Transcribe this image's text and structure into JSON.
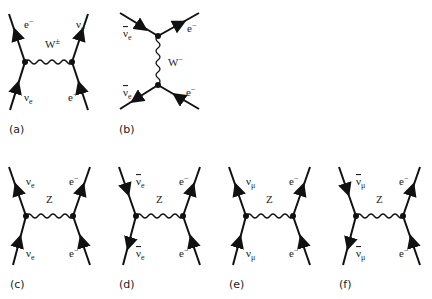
{
  "figure": {
    "diagrams": [
      {
        "id": "a",
        "caption": "(a)",
        "boson": "W±",
        "boson_base": "W",
        "boson_sup": "±",
        "incoming_left": {
          "base": "ν",
          "sub": "e",
          "bar": false
        },
        "outgoing_left": {
          "base": "e",
          "sup": "−",
          "bar": false
        },
        "outgoing_right": {
          "base": "ν",
          "sub": "e",
          "bar": false
        },
        "incoming_right": {
          "base": "e",
          "sup": "−",
          "bar": false
        }
      },
      {
        "id": "b",
        "caption": "(b)",
        "boson": "W−",
        "boson_base": "W",
        "boson_sup": "−",
        "top_left": {
          "base": "ν",
          "sub": "e",
          "bar": true
        },
        "top_right": {
          "base": "e",
          "sup": "−"
        },
        "bottom_left": {
          "base": "ν",
          "sub": "e",
          "bar": true
        },
        "bottom_right": {
          "base": "e",
          "sup": "−"
        }
      },
      {
        "id": "c",
        "caption": "(c)",
        "boson": "Z",
        "top_left": {
          "base": "ν",
          "sub": "e",
          "bar": false
        },
        "bottom_left": {
          "base": "ν",
          "sub": "e",
          "bar": false
        },
        "top_right": {
          "base": "e",
          "sup": "−"
        },
        "bottom_right": {
          "base": "e",
          "sup": "−"
        }
      },
      {
        "id": "d",
        "caption": "(d)",
        "boson": "Z",
        "top_left": {
          "base": "ν",
          "sub": "e",
          "bar": true
        },
        "bottom_left": {
          "base": "ν",
          "sub": "e",
          "bar": true
        },
        "top_right": {
          "base": "e",
          "sup": "−"
        },
        "bottom_right": {
          "base": "e",
          "sup": "−"
        }
      },
      {
        "id": "e",
        "caption": "(e)",
        "boson": "Z",
        "top_left": {
          "base": "ν",
          "sub": "μ",
          "bar": false
        },
        "bottom_left": {
          "base": "ν",
          "sub": "μ",
          "bar": false
        },
        "top_right": {
          "base": "e",
          "sup": "−"
        },
        "bottom_right": {
          "base": "e",
          "sup": "−"
        }
      },
      {
        "id": "f",
        "caption": "(f)",
        "boson": "Z",
        "top_left": {
          "base": "ν",
          "sub": "μ",
          "bar": true
        },
        "bottom_left": {
          "base": "ν",
          "sub": "μ",
          "bar": true
        },
        "top_right": {
          "base": "e",
          "sup": "−"
        },
        "bottom_right": {
          "base": "e",
          "sup": "−"
        }
      }
    ]
  },
  "colors": {
    "line": "#111111",
    "text": "#222222",
    "background": "#ffffff"
  }
}
